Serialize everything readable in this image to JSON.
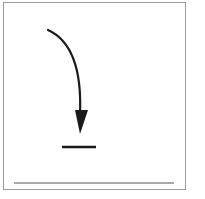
{
  "diagram": {
    "icons": {
      "frame": "square-frame",
      "arrow": "curved-down-arrow",
      "target": "short-horizontal-line",
      "baseline": "baseline"
    },
    "colors": {
      "stroke": "#1a1a1a",
      "frame": "#9a9a9a",
      "baseline": "#555555",
      "background": "#ffffff"
    }
  }
}
